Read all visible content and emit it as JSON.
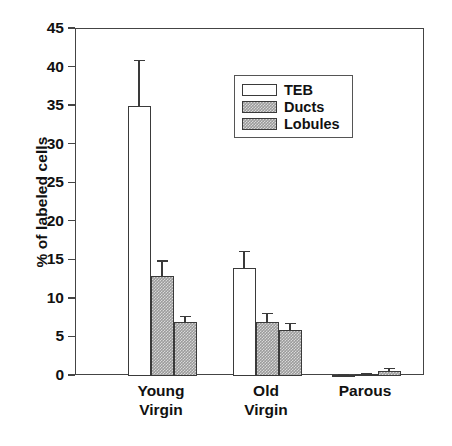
{
  "chart_data": {
    "type": "bar",
    "title": "",
    "xlabel": "",
    "ylabel": "% of labeled cells",
    "ylim": [
      0,
      45
    ],
    "ytick_values": [
      0,
      5,
      10,
      15,
      20,
      25,
      30,
      35,
      40,
      45
    ],
    "ytick_labels": [
      "0",
      "5",
      "10",
      "15",
      "20",
      "25",
      "30",
      "35",
      "40",
      "45"
    ],
    "grid": false,
    "legend_position": "upper center",
    "categories": [
      "Young Virgin",
      "Old Virgin",
      "Parous"
    ],
    "category_lines": [
      [
        "Young",
        "Virgin"
      ],
      [
        "Old",
        "Virgin"
      ],
      [
        "Parous"
      ]
    ],
    "series": [
      {
        "name": "TEB",
        "color": "#ffffff",
        "values": [
          35.0,
          14.0,
          0.15
        ],
        "errors": [
          6.0,
          2.2,
          0.1
        ]
      },
      {
        "name": "Ducts",
        "color": "#9b9b9b",
        "values": [
          13.0,
          7.0,
          0.3
        ],
        "errors": [
          2.0,
          1.2,
          0.15
        ]
      },
      {
        "name": "Lobules",
        "color": "#9b9b9b",
        "values": [
          7.0,
          6.0,
          0.7
        ],
        "errors": [
          0.8,
          0.9,
          0.35
        ]
      }
    ]
  },
  "legend": {
    "items": [
      {
        "label": "TEB"
      },
      {
        "label": "Ducts"
      },
      {
        "label": "Lobules"
      }
    ]
  },
  "axes": {
    "y_title": "% of labeled cells"
  }
}
